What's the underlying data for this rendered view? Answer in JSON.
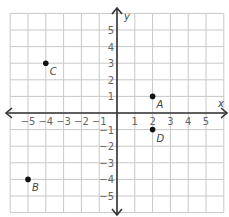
{
  "chart_data": {
    "type": "scatter",
    "title": "",
    "xlabel": "x",
    "ylabel": "y",
    "xlim": [
      -6,
      6
    ],
    "ylim": [
      -6,
      6
    ],
    "grid": true,
    "x_ticks": [
      -5,
      -4,
      -3,
      -2,
      -1,
      1,
      2,
      3,
      4,
      5
    ],
    "y_ticks": [
      -5,
      -4,
      -3,
      -2,
      -1,
      1,
      2,
      3,
      4,
      5
    ],
    "points": [
      {
        "label": "A",
        "x": 2,
        "y": 1
      },
      {
        "label": "B",
        "x": -5,
        "y": -4
      },
      {
        "label": "C",
        "x": -4,
        "y": 3
      },
      {
        "label": "D",
        "x": 2,
        "y": -1
      }
    ]
  },
  "colors": {
    "grid": "#c8c8c8",
    "axis": "#333333",
    "point": "#111111",
    "tick_text": "#666666"
  }
}
